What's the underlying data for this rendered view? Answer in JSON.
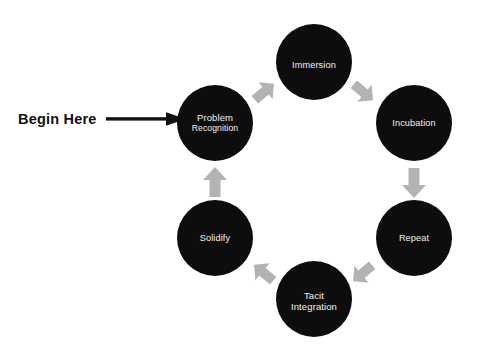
{
  "diagram": {
    "type": "cycle-diagram",
    "background_color": "#ffffff",
    "node_color": "#0d0d0d",
    "node_text_color": "#f2f2f2",
    "arrow_color": "#b3b3b3",
    "start_arrow_color": "#111111"
  },
  "start_marker": {
    "label": "Begin Here",
    "points_to": "Problem Recognition"
  },
  "nodes": [
    {
      "id": "problem-recognition",
      "lines": [
        "Problem",
        "Recognition"
      ],
      "line1": "Problem",
      "line2": "Recognition",
      "cx": 215,
      "cy": 123,
      "r": 38
    },
    {
      "id": "immersion",
      "lines": [
        "Immersion"
      ],
      "line1": "Immersion",
      "cx": 314,
      "cy": 62,
      "r": 38
    },
    {
      "id": "incubation",
      "lines": [
        "Incubation"
      ],
      "line1": "Incubation",
      "cx": 414,
      "cy": 123,
      "r": 38
    },
    {
      "id": "repeat",
      "lines": [
        "Repeat"
      ],
      "line1": "Repeat",
      "cx": 414,
      "cy": 238,
      "r": 38
    },
    {
      "id": "tacit-integration",
      "lines": [
        "Tacit",
        "Integration"
      ],
      "line1": "Tacit",
      "line2": "Integration",
      "cx": 314,
      "cy": 299,
      "r": 38
    },
    {
      "id": "solidify",
      "lines": [
        "Solidify"
      ],
      "line1": "Solidify",
      "cx": 215,
      "cy": 238,
      "r": 38
    }
  ],
  "flow_arrows": [
    {
      "id": "arrow-problem-to-immersion",
      "from": "Problem Recognition",
      "to": "Immersion",
      "direction": "up-right"
    },
    {
      "id": "arrow-immersion-to-incubation",
      "from": "Immersion",
      "to": "Incubation",
      "direction": "down-right"
    },
    {
      "id": "arrow-incubation-to-repeat",
      "from": "Incubation",
      "to": "Repeat",
      "direction": "down"
    },
    {
      "id": "arrow-repeat-to-tacit",
      "from": "Repeat",
      "to": "Tacit Integration",
      "direction": "down-left"
    },
    {
      "id": "arrow-tacit-to-solidify",
      "from": "Tacit Integration",
      "to": "Solidify",
      "direction": "up-left"
    },
    {
      "id": "arrow-solidify-to-problem",
      "from": "Solidify",
      "to": "Problem Recognition",
      "direction": "up"
    }
  ]
}
